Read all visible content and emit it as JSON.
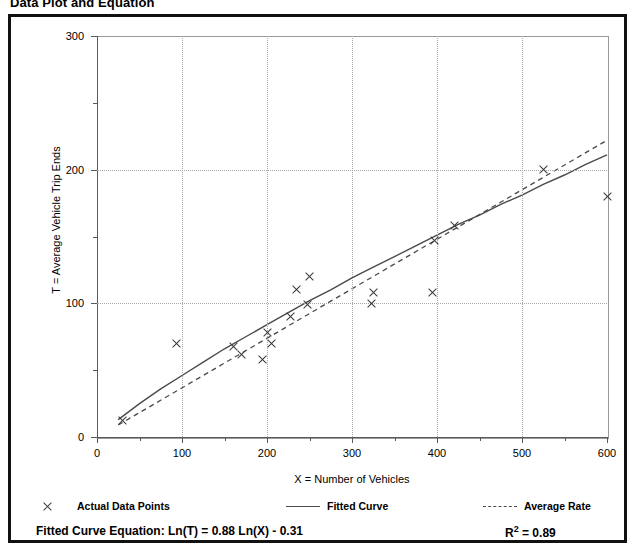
{
  "title": "Data Plot and Equation",
  "chart_data": {
    "type": "scatter",
    "title": "Data Plot and Equation",
    "xlabel": "X = Number of Vehicles",
    "ylabel": "T = Average Vehicle Trip Ends",
    "xlim": [
      0,
      600
    ],
    "ylim": [
      0,
      300
    ],
    "xticks": [
      0,
      100,
      200,
      300,
      400,
      500,
      600
    ],
    "xticks_minor": [
      50,
      150,
      250,
      350,
      450,
      550
    ],
    "yticks": [
      0,
      100,
      200,
      300
    ],
    "yticks_minor": [
      50,
      150,
      250
    ],
    "grid": true,
    "legend_position": "below-axes",
    "series": [
      {
        "name": "Actual Data Points",
        "type": "scatter",
        "marker": "x",
        "color": "#3a3a3a",
        "points": [
          [
            30,
            12
          ],
          [
            93,
            70
          ],
          [
            160,
            68
          ],
          [
            170,
            62
          ],
          [
            195,
            58
          ],
          [
            200,
            78
          ],
          [
            205,
            70
          ],
          [
            228,
            90
          ],
          [
            235,
            110
          ],
          [
            248,
            99
          ],
          [
            250,
            120
          ],
          [
            323,
            100
          ],
          [
            325,
            108
          ],
          [
            395,
            108
          ],
          [
            397,
            147
          ],
          [
            420,
            158
          ],
          [
            525,
            200
          ],
          [
            600,
            180
          ]
        ]
      },
      {
        "name": "Fitted Curve",
        "type": "line",
        "style": "solid",
        "color": "#4a4a4a",
        "equation": "Ln(T) = 0.88 Ln(X) - 0.31",
        "points": [
          [
            25,
            13
          ],
          [
            50,
            25
          ],
          [
            75,
            36
          ],
          [
            100,
            46
          ],
          [
            125,
            56
          ],
          [
            150,
            66
          ],
          [
            175,
            75
          ],
          [
            200,
            84
          ],
          [
            225,
            93
          ],
          [
            250,
            102
          ],
          [
            275,
            110
          ],
          [
            300,
            119
          ],
          [
            325,
            127
          ],
          [
            350,
            135
          ],
          [
            375,
            143
          ],
          [
            400,
            151
          ],
          [
            425,
            159
          ],
          [
            450,
            166
          ],
          [
            475,
            174
          ],
          [
            500,
            181
          ],
          [
            525,
            189
          ],
          [
            550,
            196
          ],
          [
            575,
            204
          ],
          [
            600,
            211
          ]
        ]
      },
      {
        "name": "Average Rate",
        "type": "line",
        "style": "dashed",
        "color": "#4a4a4a",
        "points": [
          [
            25,
            9
          ],
          [
            600,
            222
          ]
        ]
      }
    ]
  },
  "axis": {
    "x_title": "X = Number of Vehicles",
    "y_title": "T = Average Vehicle Trip Ends",
    "x_tick_labels": [
      "0",
      "100",
      "200",
      "300",
      "400",
      "500",
      "600"
    ],
    "y_tick_labels": [
      "0",
      "100",
      "200",
      "300"
    ]
  },
  "legend": {
    "items": [
      {
        "label": "Actual Data Points",
        "marker": "x-marker"
      },
      {
        "label": "Fitted Curve",
        "marker": "solid-line"
      },
      {
        "label": "Average Rate",
        "marker": "dashed-line"
      }
    ]
  },
  "equation": {
    "label": "Fitted Curve Equation:",
    "formula": "Ln(T) = 0.88 Ln(X) - 0.31",
    "full": "Fitted Curve Equation:  Ln(T) = 0.88 Ln(X) - 0.31",
    "r_squared_symbol": "R",
    "r_squared_exp": "2",
    "r_squared_value": "= 0.89",
    "r_squared_full": "R2 = 0.89"
  },
  "colors": {
    "frame": "#111111",
    "grid": "#a8a8a8",
    "axis": "#5a5a5a",
    "marker": "#3a3a3a",
    "curve": "#4a4a4a"
  }
}
